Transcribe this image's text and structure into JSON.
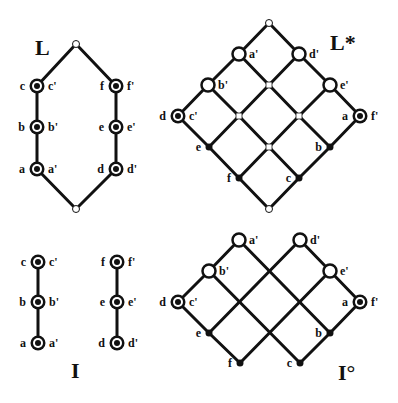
{
  "colors": {
    "ink": "#111111",
    "paper": "#ffffff"
  },
  "node_styles": {
    "bullseye": "double circle (black ring, white gap, black center)",
    "open": "hollow circle, thick black outline",
    "small-open": "small hollow circle",
    "dot": "small filled black dot",
    "square": "small hollow square junction"
  },
  "figures": [
    {
      "id": "L",
      "title": "L",
      "title_pos": [
        35,
        55
      ],
      "nodes": [
        {
          "id": "top",
          "x": 76,
          "y": 44,
          "style": "small-open"
        },
        {
          "id": "c",
          "x": 37,
          "y": 86,
          "style": "bullseye",
          "left": "c",
          "right": "c'"
        },
        {
          "id": "b",
          "x": 37,
          "y": 127,
          "style": "bullseye",
          "left": "b",
          "right": "b'"
        },
        {
          "id": "a",
          "x": 37,
          "y": 169,
          "style": "bullseye",
          "left": "a",
          "right": "a'"
        },
        {
          "id": "f",
          "x": 116,
          "y": 86,
          "style": "bullseye",
          "left": "f",
          "right": "f'"
        },
        {
          "id": "e",
          "x": 116,
          "y": 127,
          "style": "bullseye",
          "left": "e",
          "right": "e'"
        },
        {
          "id": "d",
          "x": 116,
          "y": 169,
          "style": "bullseye",
          "left": "d",
          "right": "d'"
        },
        {
          "id": "bottom",
          "x": 76,
          "y": 209,
          "style": "small-open"
        }
      ],
      "edges": [
        [
          "top",
          "c"
        ],
        [
          "c",
          "b"
        ],
        [
          "b",
          "a"
        ],
        [
          "a",
          "bottom"
        ],
        [
          "top",
          "f"
        ],
        [
          "f",
          "e"
        ],
        [
          "e",
          "d"
        ],
        [
          "d",
          "bottom"
        ]
      ]
    },
    {
      "id": "Lstar",
      "title": "L*",
      "title_pos": [
        330,
        50
      ],
      "nodes": [
        {
          "id": "top",
          "x": 269,
          "y": 23,
          "style": "small-open"
        },
        {
          "id": "a1",
          "x": 239,
          "y": 54,
          "style": "open",
          "right": "a'"
        },
        {
          "id": "b1",
          "x": 208,
          "y": 85,
          "style": "open",
          "right": "b'"
        },
        {
          "id": "dc1",
          "x": 178,
          "y": 116,
          "style": "bullseye",
          "left": "d",
          "right": "c'"
        },
        {
          "id": "d1",
          "x": 299,
          "y": 54,
          "style": "open",
          "right": "d'"
        },
        {
          "id": "e1",
          "x": 330,
          "y": 85,
          "style": "open",
          "right": "e'"
        },
        {
          "id": "af1",
          "x": 360,
          "y": 116,
          "style": "bullseye",
          "left": "a",
          "right": "f'"
        },
        {
          "id": "j11",
          "x": 269,
          "y": 85,
          "style": "square"
        },
        {
          "id": "j12",
          "x": 239,
          "y": 116,
          "style": "square"
        },
        {
          "id": "j21",
          "x": 299,
          "y": 116,
          "style": "square"
        },
        {
          "id": "j22",
          "x": 269,
          "y": 147,
          "style": "square"
        },
        {
          "id": "e",
          "x": 209,
          "y": 147,
          "style": "dot",
          "left": "e"
        },
        {
          "id": "f",
          "x": 239,
          "y": 178,
          "style": "dot",
          "left": "f"
        },
        {
          "id": "b",
          "x": 330,
          "y": 147,
          "style": "dot",
          "left": "b"
        },
        {
          "id": "c",
          "x": 299,
          "y": 178,
          "style": "dot",
          "left": "c"
        },
        {
          "id": "bottom",
          "x": 269,
          "y": 209,
          "style": "small-open"
        }
      ],
      "edges": [
        [
          "top",
          "a1"
        ],
        [
          "a1",
          "b1"
        ],
        [
          "b1",
          "dc1"
        ],
        [
          "top",
          "d1"
        ],
        [
          "d1",
          "e1"
        ],
        [
          "e1",
          "af1"
        ],
        [
          "dc1",
          "e"
        ],
        [
          "e",
          "f"
        ],
        [
          "f",
          "bottom"
        ],
        [
          "af1",
          "b"
        ],
        [
          "b",
          "c"
        ],
        [
          "c",
          "bottom"
        ],
        [
          "a1",
          "j11"
        ],
        [
          "j11",
          "j21"
        ],
        [
          "j21",
          "b"
        ],
        [
          "b1",
          "j12"
        ],
        [
          "j12",
          "j22"
        ],
        [
          "j22",
          "c"
        ],
        [
          "d1",
          "j11"
        ],
        [
          "j11",
          "j12"
        ],
        [
          "j12",
          "e"
        ],
        [
          "e1",
          "j21"
        ],
        [
          "j21",
          "j22"
        ],
        [
          "j22",
          "f"
        ]
      ]
    },
    {
      "id": "I",
      "title": "I",
      "title_pos": [
        71,
        378
      ],
      "nodes": [
        {
          "id": "c",
          "x": 38,
          "y": 262,
          "style": "bullseye",
          "left": "c",
          "right": "c'"
        },
        {
          "id": "b",
          "x": 38,
          "y": 302,
          "style": "bullseye",
          "left": "b",
          "right": "b'"
        },
        {
          "id": "a",
          "x": 38,
          "y": 343,
          "style": "bullseye",
          "left": "a",
          "right": "a'"
        },
        {
          "id": "f",
          "x": 117,
          "y": 262,
          "style": "bullseye",
          "left": "f",
          "right": "f'"
        },
        {
          "id": "e",
          "x": 117,
          "y": 302,
          "style": "bullseye",
          "left": "e",
          "right": "e'"
        },
        {
          "id": "d",
          "x": 117,
          "y": 343,
          "style": "bullseye",
          "left": "d",
          "right": "d'"
        }
      ],
      "edges": [
        [
          "c",
          "b"
        ],
        [
          "b",
          "a"
        ],
        [
          "f",
          "e"
        ],
        [
          "e",
          "d"
        ]
      ]
    },
    {
      "id": "Io",
      "title": "I°",
      "title_pos": [
        338,
        380
      ],
      "nodes": [
        {
          "id": "a1",
          "x": 239,
          "y": 240,
          "style": "open",
          "right": "a'"
        },
        {
          "id": "b1",
          "x": 209,
          "y": 271,
          "style": "open",
          "right": "b'"
        },
        {
          "id": "dc1",
          "x": 178,
          "y": 302,
          "style": "bullseye",
          "left": "d",
          "right": "c'"
        },
        {
          "id": "e",
          "x": 209,
          "y": 333,
          "style": "dot",
          "left": "e"
        },
        {
          "id": "f",
          "x": 240,
          "y": 363,
          "style": "dot",
          "left": "f"
        },
        {
          "id": "d1",
          "x": 300,
          "y": 240,
          "style": "open",
          "right": "d'"
        },
        {
          "id": "e1",
          "x": 330,
          "y": 271,
          "style": "open",
          "right": "e'"
        },
        {
          "id": "af1",
          "x": 360,
          "y": 302,
          "style": "bullseye",
          "left": "a",
          "right": "f'"
        },
        {
          "id": "b",
          "x": 330,
          "y": 333,
          "style": "dot",
          "left": "b"
        },
        {
          "id": "c",
          "x": 300,
          "y": 363,
          "style": "dot",
          "left": "c"
        }
      ],
      "edges": [
        [
          "a1",
          "b1"
        ],
        [
          "b1",
          "dc1"
        ],
        [
          "dc1",
          "e"
        ],
        [
          "e",
          "f"
        ],
        [
          "d1",
          "e1"
        ],
        [
          "e1",
          "af1"
        ],
        [
          "af1",
          "b"
        ],
        [
          "b",
          "c"
        ],
        [
          "a1",
          "b"
        ],
        [
          "b1",
          "c"
        ],
        [
          "d1",
          "e"
        ],
        [
          "e1",
          "f"
        ]
      ]
    }
  ]
}
